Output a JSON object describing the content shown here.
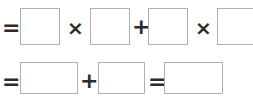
{
  "row1": {
    "operators": [
      "=",
      "×",
      "+",
      "×"
    ],
    "boxes": [
      "",
      "",
      "",
      ""
    ]
  },
  "row2": {
    "operators": [
      "=",
      "+",
      "="
    ],
    "boxes": [
      "",
      "",
      ""
    ]
  },
  "colors": {
    "box_border": "#b0b0b0",
    "operator": "#2a2a2a"
  }
}
